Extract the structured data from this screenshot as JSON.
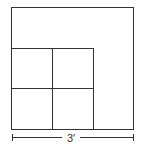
{
  "diagram": {
    "outer_square": {
      "side_label": "3′"
    },
    "inner_grid": {
      "rows": 2,
      "cols": 2,
      "description": "2×2 grid of small squares in lower-left corner"
    },
    "dimension": {
      "label": "3′"
    },
    "colors": {
      "stroke": "#333333",
      "background": "#ffffff"
    }
  }
}
